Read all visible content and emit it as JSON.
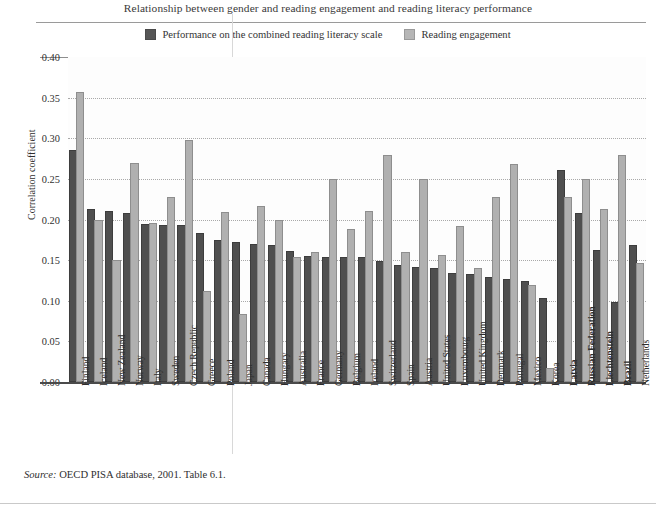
{
  "chart_data": {
    "type": "bar",
    "title": "Relationship between gender and reading engagement and reading literacy performance",
    "xlabel": "",
    "ylabel": "Correlation coefficient",
    "ylim": [
      0.0,
      0.4
    ],
    "yticks": [
      "0.40",
      "0.35",
      "0.30",
      "0.25",
      "0.20",
      "0.15",
      "0.10",
      "0.05",
      "0.00"
    ],
    "ytick_values": [
      0.4,
      0.35,
      0.3,
      0.25,
      0.2,
      0.15,
      0.1,
      0.05,
      0.0
    ],
    "grid": true,
    "legend_position": "top-center",
    "categories": [
      "Finland",
      "Iceland",
      "New Zealand",
      "Norway",
      "Italy",
      "Sweden",
      "Czech Republic",
      "Greece",
      "Poland",
      "Japan",
      "Canada",
      "Hungary",
      "Australia",
      "France",
      "Germany",
      "Belgium",
      "Ireland",
      "Switzerland",
      "Spain",
      "Austria",
      "United States",
      "Luxembourg",
      "United Kingdom",
      "Denmark",
      "Portugal",
      "Mexico",
      "Korea",
      "Latvia",
      "Russian Federation",
      "Liechtenstein",
      "Brazil",
      "Netherlands"
    ],
    "categories_bold": [
      "Latvia",
      "Russian Federation",
      "Liechtenstein",
      "Brazil"
    ],
    "series": [
      {
        "name": "Performance on the combined reading literacy scale",
        "color": "#4f4f4f",
        "values": [
          0.283,
          0.211,
          0.208,
          0.206,
          0.192,
          0.191,
          0.191,
          0.181,
          0.172,
          0.17,
          0.168,
          0.166,
          0.159,
          0.153,
          0.152,
          0.152,
          0.152,
          0.146,
          0.141,
          0.139,
          0.138,
          0.132,
          0.13,
          0.127,
          0.124,
          0.122,
          0.101,
          0.258,
          0.205,
          0.16,
          0.096,
          0.166
        ]
      },
      {
        "name": "Reading engagement",
        "color": "#b0b0b0",
        "values": [
          0.355,
          0.197,
          0.148,
          0.267,
          0.193,
          0.225,
          0.295,
          0.109,
          0.207,
          0.081,
          0.214,
          0.197,
          0.152,
          0.158,
          0.247,
          0.186,
          0.208,
          0.277,
          0.157,
          0.247,
          0.154,
          0.19,
          0.138,
          0.225,
          0.266,
          0.117,
          0.015,
          0.225,
          0.247,
          0.21,
          0.277,
          0.144
        ]
      }
    ]
  },
  "legend": {
    "items": [
      {
        "label": "Performance on the combined reading literacy scale",
        "swatch": "dark"
      },
      {
        "label": "Reading engagement",
        "swatch": "light"
      }
    ]
  },
  "footer": {
    "source_prefix": "Source:",
    "source_text": " OECD PISA database, 2001. Table 6.1."
  }
}
